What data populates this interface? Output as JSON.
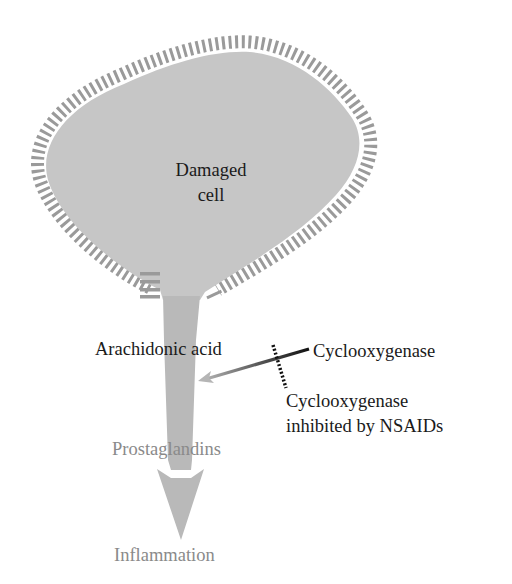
{
  "diagram": {
    "cell_label": [
      "Damaged",
      "cell"
    ],
    "labels": {
      "substrate": "Arachidonic acid",
      "enzyme": "Cyclooxygenase",
      "inhibited_line1": "Cyclooxygenase",
      "inhibited_line2": "inhibited by NSAIDs",
      "product": "Prostaglandins",
      "outcome": "Inflammation"
    },
    "colors": {
      "cell_fill": "#c6c6c6",
      "membrane": "#9a9a9a",
      "pathway_arrow": "#b9b9b9",
      "enzyme_line_start": "#111111",
      "enzyme_line_end": "#b0b0b0",
      "inhibition_marker": "#111111",
      "muted_text": "#8a8a8a",
      "text": "#1a1a1a"
    },
    "flow": [
      "Damaged cell",
      "Arachidonic acid",
      "Prostaglandins",
      "Inflammation"
    ]
  }
}
